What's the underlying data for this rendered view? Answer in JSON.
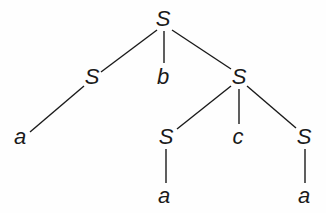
{
  "diagram": {
    "type": "parse-tree",
    "nodes": [
      {
        "id": "n0",
        "label": "S",
        "x": 163,
        "y": 19
      },
      {
        "id": "n1",
        "label": "S",
        "x": 92,
        "y": 77
      },
      {
        "id": "n2",
        "label": "b",
        "x": 163,
        "y": 77
      },
      {
        "id": "n3",
        "label": "S",
        "x": 239,
        "y": 77
      },
      {
        "id": "n4",
        "label": "a",
        "x": 20,
        "y": 137
      },
      {
        "id": "n5",
        "label": "S",
        "x": 166,
        "y": 137
      },
      {
        "id": "n6",
        "label": "c",
        "x": 238,
        "y": 137
      },
      {
        "id": "n7",
        "label": "S",
        "x": 304,
        "y": 137
      },
      {
        "id": "n8",
        "label": "a",
        "x": 164,
        "y": 196
      },
      {
        "id": "n9",
        "label": "a",
        "x": 304,
        "y": 196
      }
    ],
    "edges": [
      {
        "from": "n0",
        "to": "n1",
        "x1": 157,
        "y1": 30,
        "x2": 101,
        "y2": 72
      },
      {
        "from": "n0",
        "to": "n2",
        "x1": 164,
        "y1": 31,
        "x2": 164,
        "y2": 63
      },
      {
        "from": "n0",
        "to": "n3",
        "x1": 172,
        "y1": 30,
        "x2": 231,
        "y2": 69
      },
      {
        "from": "n1",
        "to": "n4",
        "x1": 84,
        "y1": 86,
        "x2": 30,
        "y2": 132
      },
      {
        "from": "n3",
        "to": "n5",
        "x1": 231,
        "y1": 86,
        "x2": 177,
        "y2": 129
      },
      {
        "from": "n3",
        "to": "n6",
        "x1": 239,
        "y1": 89,
        "x2": 239,
        "y2": 124
      },
      {
        "from": "n3",
        "to": "n7",
        "x1": 247,
        "y1": 86,
        "x2": 296,
        "y2": 128
      },
      {
        "from": "n5",
        "to": "n8",
        "x1": 166,
        "y1": 149,
        "x2": 166,
        "y2": 183
      },
      {
        "from": "n7",
        "to": "n9",
        "x1": 305,
        "y1": 149,
        "x2": 305,
        "y2": 183
      }
    ]
  }
}
